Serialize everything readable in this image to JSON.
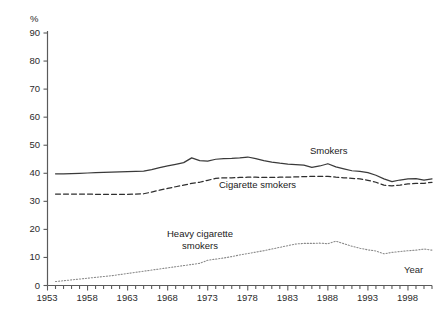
{
  "chart_data": {
    "type": "line",
    "title": "",
    "xlabel": "Year",
    "ylabel": "%",
    "ylim": [
      0,
      90
    ],
    "xlim": [
      1953,
      2001
    ],
    "grid": false,
    "legend_position": "inline-annotations",
    "ytick_labels": [
      "90",
      "80",
      "70",
      "60",
      "50",
      "40",
      "30",
      "20",
      "10",
      "0"
    ],
    "ytick_values": [
      90,
      80,
      70,
      60,
      50,
      40,
      30,
      20,
      10,
      0
    ],
    "xtick_labels": [
      "1953",
      "1958",
      "1963",
      "1968",
      "1973",
      "1978",
      "1983",
      "1988",
      "1993",
      "1998"
    ],
    "xtick_values": [
      1953,
      1958,
      1963,
      1968,
      1973,
      1978,
      1983,
      1988,
      1993,
      1998
    ],
    "x": [
      1954,
      1955,
      1956,
      1957,
      1958,
      1959,
      1960,
      1961,
      1962,
      1963,
      1964,
      1965,
      1966,
      1967,
      1968,
      1969,
      1970,
      1971,
      1972,
      1973,
      1974,
      1975,
      1976,
      1977,
      1978,
      1979,
      1980,
      1981,
      1982,
      1983,
      1984,
      1985,
      1986,
      1987,
      1988,
      1989,
      1990,
      1991,
      1992,
      1993,
      1994,
      1995,
      1996,
      1997,
      1998,
      1999,
      2000,
      2001
    ],
    "series": [
      {
        "name": "Smokers",
        "style": "solid",
        "color": "#3a3a3a",
        "values": [
          39.8,
          39.8,
          39.9,
          40.0,
          40.1,
          40.2,
          40.3,
          40.4,
          40.5,
          40.6,
          40.7,
          40.8,
          41.3,
          42.0,
          42.6,
          43.2,
          43.8,
          45.5,
          44.5,
          44.3,
          45.0,
          45.2,
          45.3,
          45.5,
          45.8,
          45.2,
          44.5,
          44.0,
          43.6,
          43.3,
          43.1,
          42.9,
          42.1,
          42.6,
          43.4,
          42.3,
          41.6,
          40.9,
          40.7,
          40.2,
          39.3,
          38.0,
          37.0,
          37.6,
          38.0,
          38.1,
          37.6,
          38.0
        ],
        "label_text": "Smokers"
      },
      {
        "name": "Cigarette smokers",
        "style": "dashed",
        "color": "#2e2e2e",
        "values": [
          32.6,
          32.6,
          32.6,
          32.6,
          32.6,
          32.5,
          32.5,
          32.5,
          32.5,
          32.5,
          32.6,
          32.7,
          33.3,
          34.0,
          34.6,
          35.2,
          35.8,
          36.4,
          36.8,
          37.5,
          38.2,
          38.4,
          38.4,
          38.5,
          38.6,
          38.6,
          38.5,
          38.5,
          38.6,
          38.6,
          38.7,
          38.8,
          38.9,
          38.9,
          38.9,
          38.6,
          38.4,
          38.2,
          38.0,
          37.5,
          36.8,
          35.8,
          35.5,
          35.8,
          36.2,
          36.4,
          36.4,
          36.8
        ],
        "label_text": "Cigarette smokers"
      },
      {
        "name": "Heavy cigarette smokers",
        "style": "dotted",
        "color": "#8a8a8a",
        "values": [
          1.4,
          1.7,
          2.0,
          2.3,
          2.6,
          2.9,
          3.2,
          3.5,
          3.9,
          4.3,
          4.7,
          5.1,
          5.5,
          5.9,
          6.3,
          6.7,
          7.1,
          7.5,
          7.9,
          9.0,
          9.4,
          9.8,
          10.3,
          10.9,
          11.4,
          11.9,
          12.4,
          13.0,
          13.6,
          14.2,
          14.8,
          15.0,
          15.0,
          15.1,
          14.9,
          15.8,
          14.9,
          14.0,
          13.3,
          12.7,
          12.3,
          11.3,
          11.8,
          12.1,
          12.4,
          12.6,
          13.0,
          12.6
        ],
        "label_text": "Heavy cigarette smokers"
      }
    ],
    "annotations": [
      {
        "name": "smokers-label",
        "text": "Smokers"
      },
      {
        "name": "cigarette-smokers-label",
        "text": "Cigarette smokers"
      },
      {
        "name": "heavy-line1",
        "text": "Heavy cigarette"
      },
      {
        "name": "heavy-line2",
        "text": "smokers"
      },
      {
        "name": "year-axis-label",
        "text": "Year"
      },
      {
        "name": "percent-unit-label",
        "text": "%"
      }
    ]
  }
}
